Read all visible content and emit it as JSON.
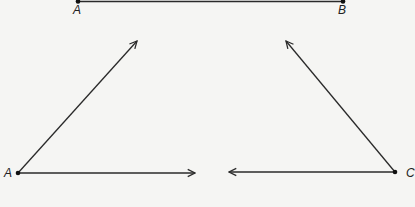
{
  "diagram": {
    "segment": {
      "start_label": "A",
      "end_label": "B"
    },
    "angle_left": {
      "vertex_label": "A",
      "rays": [
        "up-right",
        "right"
      ]
    },
    "angle_right": {
      "vertex_label": "C",
      "rays": [
        "up-left",
        "left"
      ]
    },
    "colors": {
      "line": "#2a2a2a",
      "background": "#f5f5f3"
    }
  }
}
